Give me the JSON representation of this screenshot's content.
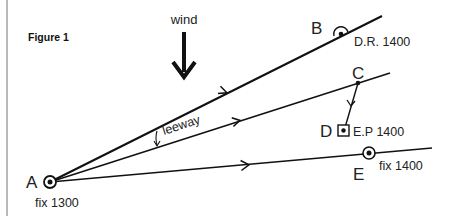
{
  "figure": {
    "title": "Figure 1",
    "wind_label": "wind",
    "leeway_label": "leeway"
  },
  "points": {
    "A": {
      "letter": "A",
      "note": "fix 1300",
      "x": 50,
      "y": 182
    },
    "B": {
      "letter": "B",
      "note": "D.R. 1400",
      "x": 341,
      "y": 34
    },
    "C": {
      "letter": "C",
      "note": "",
      "x": 358,
      "y": 83
    },
    "D": {
      "letter": "D",
      "note": "E.P 1400",
      "x": 344,
      "y": 131
    },
    "E": {
      "letter": "E",
      "note": "fix 1400",
      "x": 369,
      "y": 153
    }
  },
  "lines": [
    {
      "name": "course-line-ab",
      "from": "A",
      "to_end": [
        382,
        16
      ]
    },
    {
      "name": "track-line-ac",
      "from": "A",
      "to_end": [
        390,
        73
      ]
    },
    {
      "name": "track-line-ae",
      "from": "A",
      "to_end": [
        432,
        148
      ]
    },
    {
      "name": "tide-vector-cd",
      "from": "C",
      "to": "D"
    }
  ],
  "colors": {
    "ink": "#111111",
    "border": "#888888",
    "background": "#ffffff"
  }
}
